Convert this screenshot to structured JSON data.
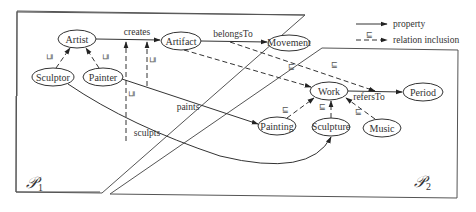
{
  "diagram": {
    "partitions": [
      {
        "id": "P1",
        "label": "𝒫",
        "subscript": "1"
      },
      {
        "id": "P2",
        "label": "𝒫",
        "subscript": "2"
      }
    ],
    "nodes": {
      "artist": "Artist",
      "sculptor": "Sculptor",
      "painter": "Painter",
      "artifact": "Artifact",
      "movement": "Movement",
      "work": "Work",
      "period": "Period",
      "painting": "Painting",
      "sculpture": "Sculpture",
      "music": "Music"
    },
    "edges": {
      "creates": "creates",
      "belongsTo": "belongsTo",
      "refersTo": "refersTo",
      "paints": "paints",
      "sculpts": "sculpts"
    },
    "subsumption_symbol": "⊑",
    "legend": {
      "property": "property",
      "relation_inclusion": "relation inclusion",
      "symbol": "⊑"
    }
  }
}
